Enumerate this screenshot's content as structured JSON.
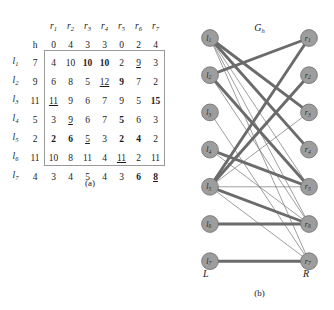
{
  "figure": {
    "panel_a": {
      "caption": "(a)",
      "h_label": "h",
      "col_labels": [
        "r",
        "r",
        "r",
        "r",
        "r",
        "r",
        "r"
      ],
      "col_subs": [
        "1",
        "2",
        "3",
        "4",
        "5",
        "6",
        "7"
      ],
      "row_labels": [
        "l",
        "l",
        "l",
        "l",
        "l",
        "l",
        "l"
      ],
      "row_subs": [
        "1",
        "2",
        "3",
        "4",
        "5",
        "6",
        "7"
      ],
      "h_row": [
        "0",
        "4",
        "3",
        "3",
        "0",
        "2",
        "4"
      ],
      "h_col": [
        "7",
        "9",
        "11",
        "5",
        "2",
        "11",
        "4"
      ],
      "rows": [
        [
          {
            "v": "4",
            "style": "plain"
          },
          {
            "v": "10",
            "style": "plain"
          },
          {
            "v": "10",
            "style": "bold"
          },
          {
            "v": "10",
            "style": "bold"
          },
          {
            "v": "2",
            "style": "plain"
          },
          {
            "v": "9",
            "style": "underline"
          },
          {
            "v": "3",
            "style": "plain"
          }
        ],
        [
          {
            "v": "6",
            "style": "plain"
          },
          {
            "v": "8",
            "style": "plain"
          },
          {
            "v": "5",
            "style": "plain"
          },
          {
            "v": "12",
            "style": "underline"
          },
          {
            "v": "9",
            "style": "bold"
          },
          {
            "v": "7",
            "style": "plain"
          },
          {
            "v": "2",
            "style": "plain"
          }
        ],
        [
          {
            "v": "11",
            "style": "underline"
          },
          {
            "v": "9",
            "style": "plain"
          },
          {
            "v": "6",
            "style": "plain"
          },
          {
            "v": "7",
            "style": "plain"
          },
          {
            "v": "9",
            "style": "plain"
          },
          {
            "v": "5",
            "style": "plain"
          },
          {
            "v": "15",
            "style": "bold"
          }
        ],
        [
          {
            "v": "3",
            "style": "plain"
          },
          {
            "v": "9",
            "style": "underline"
          },
          {
            "v": "6",
            "style": "plain"
          },
          {
            "v": "7",
            "style": "plain"
          },
          {
            "v": "5",
            "style": "bold"
          },
          {
            "v": "6",
            "style": "plain"
          },
          {
            "v": "3",
            "style": "plain"
          }
        ],
        [
          {
            "v": "2",
            "style": "bold"
          },
          {
            "v": "6",
            "style": "bold"
          },
          {
            "v": "5",
            "style": "underline"
          },
          {
            "v": "3",
            "style": "plain"
          },
          {
            "v": "2",
            "style": "bold"
          },
          {
            "v": "4",
            "style": "bold"
          },
          {
            "v": "2",
            "style": "plain"
          }
        ],
        [
          {
            "v": "10",
            "style": "plain"
          },
          {
            "v": "8",
            "style": "plain"
          },
          {
            "v": "11",
            "style": "plain"
          },
          {
            "v": "4",
            "style": "plain"
          },
          {
            "v": "11",
            "style": "underline"
          },
          {
            "v": "2",
            "style": "plain"
          },
          {
            "v": "11",
            "style": "plain"
          }
        ],
        [
          {
            "v": "3",
            "style": "plain"
          },
          {
            "v": "4",
            "style": "plain"
          },
          {
            "v": "5",
            "style": "plain"
          },
          {
            "v": "4",
            "style": "plain"
          },
          {
            "v": "3",
            "style": "plain"
          },
          {
            "v": "6",
            "style": "bold"
          },
          {
            "v": "8",
            "style": "bold-underline"
          }
        ]
      ]
    },
    "panel_b": {
      "caption": "(b)",
      "title": "G",
      "title_sub": "h",
      "left_side_label": "L",
      "right_side_label": "R",
      "left_nodes": [
        {
          "id": "l1",
          "base": "l",
          "sub": "1"
        },
        {
          "id": "l2",
          "base": "l",
          "sub": "2"
        },
        {
          "id": "l3",
          "base": "l",
          "sub": "3"
        },
        {
          "id": "l4",
          "base": "l",
          "sub": "4"
        },
        {
          "id": "l5",
          "base": "l",
          "sub": "5"
        },
        {
          "id": "l6",
          "base": "l",
          "sub": "6"
        },
        {
          "id": "l7",
          "base": "l",
          "sub": "7"
        }
      ],
      "right_nodes": [
        {
          "id": "r1",
          "base": "r",
          "sub": "1"
        },
        {
          "id": "r2",
          "base": "r",
          "sub": "2"
        },
        {
          "id": "r3",
          "base": "r",
          "sub": "3"
        },
        {
          "id": "r4",
          "base": "r",
          "sub": "4"
        },
        {
          "id": "r5",
          "base": "r",
          "sub": "5"
        },
        {
          "id": "r6",
          "base": "r",
          "sub": "6"
        },
        {
          "id": "r7",
          "base": "r",
          "sub": "7"
        }
      ],
      "edges": [
        {
          "from": 0,
          "to": 2,
          "weight": 3
        },
        {
          "from": 0,
          "to": 3,
          "weight": 3
        },
        {
          "from": 0,
          "to": 4,
          "weight": 1
        },
        {
          "from": 0,
          "to": 5,
          "weight": 1
        },
        {
          "from": 0,
          "to": 6,
          "weight": 1
        },
        {
          "from": 1,
          "to": 0,
          "weight": 3
        },
        {
          "from": 1,
          "to": 4,
          "weight": 3
        },
        {
          "from": 1,
          "to": 5,
          "weight": 1
        },
        {
          "from": 2,
          "to": 6,
          "weight": 1
        },
        {
          "from": 3,
          "to": 4,
          "weight": 3
        },
        {
          "from": 3,
          "to": 5,
          "weight": 1
        },
        {
          "from": 4,
          "to": 0,
          "weight": 3
        },
        {
          "from": 4,
          "to": 1,
          "weight": 3
        },
        {
          "from": 4,
          "to": 2,
          "weight": 1
        },
        {
          "from": 4,
          "to": 4,
          "weight": 1
        },
        {
          "from": 4,
          "to": 5,
          "weight": 3
        },
        {
          "from": 4,
          "to": 6,
          "weight": 1
        },
        {
          "from": 5,
          "to": 5,
          "weight": 3
        },
        {
          "from": 6,
          "to": 6,
          "weight": 3
        }
      ],
      "node_color": "#9d9d9d",
      "edge_color": "#6b6b6b"
    }
  }
}
